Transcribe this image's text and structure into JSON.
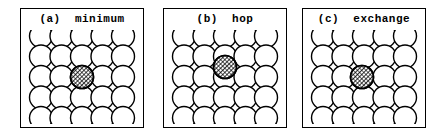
{
  "figure": {
    "width": 443,
    "height": 140,
    "background": "#ffffff",
    "stroke_color": "#000000",
    "atom_fill": "#ffffff",
    "adatom_fill_pattern": "cross-hatch"
  },
  "panels": [
    {
      "id": "a",
      "title": "(a)  minimum",
      "label": "(a)",
      "caption": "minimum",
      "frame": {
        "x": 20,
        "y": 8,
        "width": 124,
        "height": 120
      },
      "lattice": {
        "rows": 5,
        "cols": 5,
        "radius": 11.5,
        "spacing": 20.5,
        "origin_x": 15,
        "origin_y": 14
      },
      "adatom": {
        "col": 2,
        "row": 2,
        "offset_x": 0,
        "offset_y": 0,
        "radius": 11.5,
        "description": "adatom at fourfold hollow minimum site"
      }
    },
    {
      "id": "b",
      "title": "(b)  hop",
      "label": "(b)",
      "caption": "hop",
      "frame": {
        "x": 163,
        "y": 8,
        "width": 124,
        "height": 120
      },
      "lattice": {
        "rows": 5,
        "cols": 5,
        "radius": 11.5,
        "spacing": 20.5,
        "origin_x": 15,
        "origin_y": 14
      },
      "adatom": {
        "col": 2,
        "row": 2,
        "offset_x": 0,
        "offset_y": -10,
        "radius": 11.5,
        "description": "adatom hopping over bridge site, raised above lattice plane"
      }
    },
    {
      "id": "c",
      "title": "(c)  exchange",
      "label": "(c)",
      "caption": "exchange",
      "frame": {
        "x": 302,
        "y": 8,
        "width": 124,
        "height": 120
      },
      "lattice": {
        "rows": 5,
        "cols": 5,
        "radius": 11.5,
        "spacing": 20.5,
        "origin_x": 15,
        "origin_y": 14
      },
      "adatom": {
        "col": 2,
        "row": 2,
        "offset_x": -2,
        "offset_y": 0,
        "radius": 11.5,
        "description": "adatom substituted into lattice row during exchange"
      }
    }
  ]
}
